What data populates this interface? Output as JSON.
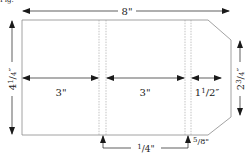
{
  "header_fragment": "Fig.",
  "dimensions": {
    "total_width": "8\"",
    "height_left": "4",
    "height_left_num": "1",
    "height_left_den": "4",
    "height_right": "2",
    "height_right_num": "3",
    "height_right_den": "4",
    "panel_1_width": "3\"",
    "panel_2_width": "3\"",
    "panel_3_width": "1",
    "panel_3_num": "1",
    "panel_3_den": "2",
    "gap_1_num": "1",
    "gap_1_den": "4\"",
    "gap_2_num": "5",
    "gap_2_den": "8\""
  },
  "colors": {
    "outline": "#8a8a8a",
    "dashed": "#9a9a9a",
    "arrow": "#1a1a1a"
  }
}
